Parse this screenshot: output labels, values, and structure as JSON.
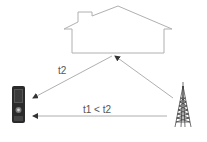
{
  "diagram": {
    "type": "signal-propagation",
    "nodes": {
      "house": {
        "label": "",
        "icon": "house-icon"
      },
      "phone": {
        "label": "",
        "icon": "mobile-phone-icon"
      },
      "tower": {
        "label": "",
        "icon": "cell-tower-icon"
      }
    },
    "edges": [
      {
        "from": "tower",
        "to": "house",
        "label": ""
      },
      {
        "from": "house",
        "to": "phone",
        "label": "t2"
      },
      {
        "from": "tower",
        "to": "phone",
        "label": "t1 < t2"
      }
    ],
    "labels": {
      "reflected_path": "t2",
      "direct_path": "t1 < t2"
    },
    "colors": {
      "outline": "#b0b0b0",
      "arrow": "#9a9a9a",
      "text": "#555555"
    }
  }
}
